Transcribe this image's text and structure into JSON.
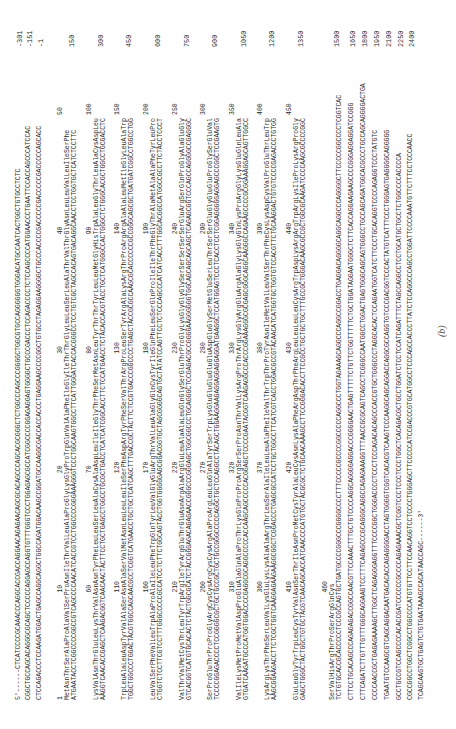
{
  "figure": {
    "label": "(b)",
    "start_marker": "5'------",
    "end_marker": "------3'"
  },
  "rows": [
    {
      "nt": "5'------CTCATCCCCGCAAACCCAGGCACCGACCAGGAACAGAGAACAGCGCACAGCCCAGCACGCGGGCTCTGGCCCAGCCCGGGGCTGGCGTGCCAGGGGGGTGGGACATGCCAATCACTGGCTGTGCCTCTC",
      "end": "-301",
      "x": 19
    },
    {
      "nt": "CGGCTGCCAGCACAGGGCGCAGCTCCCCCAGGAGCCAGGTGTTTGGGTCCCTGGAGAGCGCCATCGGCCCCGGAGAGGAGTGGGGCTGCCCGACCCTCCAGACCCCTCTCCAGCCCCATGGAACCCTGAATTCCACCAGCCCATCCAC",
      "end": "-151",
      "x": 29
    },
    {
      "nt": "CTCCAGACCCTCCAAGATGGACTGAGCCAGGCAGGCTGGCCAGATGGACAAGCCGGATGCCAAGGCGACCACCACCCTGAGGAAGCCCCGGCTGTGCCTAGAGGAAGGGGCTGCCCACCCCGACCCCCGACCCCCGACCCCCAGCACC",
      "end": "-1",
      "x": 40
    },
    {
      "pos": [
        1,
        10,
        20,
        30,
        40,
        50
      ],
      "aa": "MetAsnThrSerAlaProAlaValSerProAsnIleThrValLeuAlaProGlyLysGlyProTrpGlnValAlaPheIleGlyIleThrThrGlyLeuLeuSerLeuAlaThrValThrGlyAsnLeuLeuValLeuIleSerPhe",
      "nt": "ATGAATACCTCGGCCCCGGCCGTCAGCCCCAACATCACCGTCCTGGCCCCGGGAAAGGGTCCCTGGCAAGTGGCCTTCATTGGGATCACCACGGGCCTCCTGTCGCTAGCCACAGTGACAGGCAACCTCCTGGTGCTCATCTCCTTC",
      "end": "150",
      "x": 75
    },
    {
      "pos": [
        60,
        70,
        80,
        90,
        100
      ],
      "aa": "LysValAsnThrGluLeuLysThrValAsnAsnTyrPheLeuLeuSerLeuAlaCysAlaAspLeuIleIleGlyThrPheSerMetAsnLeuTyrThrThrTyrLeuLeuMetGlyHisTrpAlaLeuGlyThrLeuAlaCysAspLeu",
      "nt": "AAGGTCAACACCGAGCTCAAGACGGTCAACAACTACTTCCTGCTGAGCCTGGCCTGCGCTGACCTCATCATCGGCACCTTCTCCATGAACCTCTACACCACGTACCTGCTCATGGGCCACTGGGCTCTGGGCACGCTGGCCTGCGACCTC",
      "end": "300",
      "x": 104
    },
    {
      "pos": [
        110,
        120,
        130,
        140,
        150
      ],
      "aa": "TrpLeuAlaLeuAspTyrValAlaSerAsnAlaSerValMetAsnLeuLeuLeuIleSerPheAspArgTyrPheSerValThrArgProLeuSerTyrArgAlaLysArgThrProArgArgAlaAlaLeuMetIleGlyLeuAlaTrp",
      "nt": "TGGCTGGCCCTGGACTACGTGGCCAGCAACGCCTCGGTCATGAACCTGCTGCTCATCAGCTTTGACCGCTACTTCTCCGTGACCCGGCCCCTGAGCTACCGCGCCAAGCGCACCCCCCGCCGGGCAGCGCTGATGATCGGCCTGGCCTGG",
      "end": "450",
      "x": 132
    },
    {
      "pos": [
        160,
        170,
        180,
        190,
        200
      ],
      "aa": "LeuValSerPheValLeuTrpAlaProAlaIleLeuPheTrpGlnTyrLeuValGlyGluArgThrValLeuAlaGlyGlnCysTyrIleGlnPheLeuSerGlnProIleIleThrPheGlyThrAlaMetAlaAlaPheTyrLeuPro",
      "nt": "CTGGTCTCCTTCGTCCTTTGGGCCCCCGCCATCCTCTTCTGGCAGTACCTGGTGGGGGAGCGGACGGTGCTAGCGGGGCAGTGCTATATCCAGTTCCTCTCCCAGCCCATCATCACCTTTGGCACGGCCATGGCCGCCTTCTACCTCCCT",
      "end": "600",
      "x": 161
    },
    {
      "pos": [
        210,
        220,
        230,
        240,
        250
      ],
      "aa": "ValThrValMetCysThrLeuTyrTrpArgIleTyrArgGluThrGluAsnArgAlaArgGluLeuAlaAlaLeuGlnGlySerGluThrProGlyLysGlyGlyGlySerSerSerSerSerGluArgSerGlnProGlyAlaGluGly",
      "nt": "GTCACGGTCATGTGCACACTCTACTGGCGCATCTACCGGGAGACAGAGAACCGGGCCCGGGAGCTGGCGGCCCTGCAGGGCTCCGAGACGCCGGGGAAGGGGGGTGGCAGCAGCAGCAGCTCAGAGCGGTCCCAGCCAGGGGCCGAGGGC",
      "end": "750",
      "x": 190
    },
    {
      "pos": [
        260,
        270,
        280,
        290,
        300
      ],
      "aa": "SerProGluThrProProGlyArgCysCysArgCysCysArgAlaProArgLeuLeuGlnAlaTyrSerTrpLysGluGluGluGluGluAspGluGlySerMetGluSerLeuThrSerSerGluGlyGluGluProGlySerGluVal",
      "nt": "TCCCCGGAGACCCCTCCGGGGCGCTGCTGCCGCTGCTGCCGGGCCCCCAGGCTGCTCCAGGCCTACAGCTGGAAGGAAGAGGAGGAGGAGGATGAAGGCTCCATGGAGTCCCTCACCTCCTCGGAGGGGGAGGAGCCCGGCTCCGAAGTG",
      "end": "900",
      "x": 218
    },
    {
      "pos": [
        310,
        320,
        330,
        340,
        350
      ],
      "aa": "ValIleLysMetProMetValAspProGluAlaGlnAlaProThrLysGlnProProArgSerSerProAsnThrValLysArgProThrArgLysGlyArgGluArgAlaGlyLysGlyGlnLysProArgGlyLysGluGlnLeuAla",
      "nt": "GTGATCAAGATGCCCATGGTGGACCCCGAGGCGCAGGCCCCCACCAAGCAGCCCCCACGGAGCTCCCCGAATACGGTCAAGAGGCCCACCCGGAAAGGGCGCGAGCGGGCAGGCAAGGGCCAGAAGCCCCGCGGAAAGGAGCAGTTGGCC",
      "end": "1050",
      "x": 247
    },
    {
      "pos": [
        360,
        370,
        380,
        390,
        400
      ],
      "aa": "LysArgLysThrPheSerLeuValLysGluLysLysAlaAlaArgThrLeuSerAlaIleLeuLeuAlaPheIleValThrTrpThrProTyrAsnIleMetValLeuValSerThrPheCysLysAspCysValProGluThrLeuTrp",
      "nt": "AAGCGGAAGACCTTCTCGCTGGTCAAGGAGAAGAAGGCGGCTCGGACCCTGAGCGCCATCCTGCTGGCCTTCATCGTCACCTGGACGCCGTACAACATCATGGTGCTGGTGTCCACGTTCTGCAAGGACTGTGTCCCCGAGACCCTGTGG",
      "end": "1200",
      "x": 275
    },
    {
      "pos": [
        410,
        420,
        430,
        440,
        450
      ],
      "aa": "GluLeuGlyTyrTrpLeuCysTyrValAsnSerThrIleAsnProMetCysTyrAlaLeuCysAsnLysAlaPheArgAspThrPheArgLeuLeuLeuLeuCysArgTrpAspLysArgArgTrpArgLysIleProLysArgProGly",
      "nt": "GAGCTGGGCTACTGGCTGTGCTACGTCAACAGCACCATCAACCCCATGTGCTACGCGCTCTGCAACAAAGCCTTCCGGGACACCTTCCGCCTGCTGCTGCTTTGCCGCTGGGACAAGCGCCGCTGGCGCAAGATCCCCAAGCGCCCCGGC",
      "end": "1350",
      "x": 304
    },
    {
      "pos": [
        460
      ],
      "aa": "SerValHisArgThrProSerArgGlnCys",
      "nt": "TCTGTGCACCGCACCCCCTCCCGCCAGTGCTGATGCCCCGGGCCCGGGGCCCCTTTCCCCCGCCCCGGCCCCCAGGCCCTGGTAGAAAGCAGGCCCAGGCCGGACCTGAGGACAGGGGCAGGCAGGCCCAGGGGCTTCCCCCGGCCCCTCGGTCAC",
      "end": "1500",
      "x": 340
    },
    {
      "nt": "CTTCCTGCACAGCCCAGAGAGACCGGCCAACGTTCCAAACTTTGCTGTCCCCAGGCAGGGGAGGACCCGGGGAACTGAGTTTTTCTGTTCTGGTTTTTCTGCTGGATAGGAATGGGCTCTTCACCAGGAAGAAGCCCCGGGAGGAGGATCCGGG",
      "end": "1650",
      "x": 352
    },
    {
      "nt": "CTTCAGATCTTGTTTGTTTGGGCAGGAAGTCCTTTCAGAGCCCGCAGGGCAGGCCAGAGAAAGGTTTAACCGCGCAGTCAGCCTCGGGCCAATGGCCTGGACTGAGTGGGCAGCAGTGGGCCTGCCAGCAGATGGCACGCCCTGCCAGCAGGGGACTGA",
      "end": "1800",
      "x": 364
    },
    {
      "nt": "CCCCAACCGCTGAGAGAAAAGCTTGGCTCAGAGGGAGGTTTCCCCGGCTGGGACCCCTCCCTCCCAGACACAGCCCACCGTGCTGGGCCCTAGGCACACTCCAGAATGGTCATCTTCCCTGCACAGGTCCCCAGAGGTCCCTATGTC",
      "end": "1950",
      "x": 376
    },
    {
      "nt": "TGAATGTCCAAGCGTCAGCAGGACAATGACACACCAGAGGGGACCTAGTGGGGTCGGTCACACGTCAAGTCCCAAGGCAGCAGGACCAGGCGCCAGGTGTCCCGACGGTCCCACTATGTCATTTCCCTGGGAGTGAGGGGCAGGGGG",
      "end": "2100",
      "x": 388
    },
    {
      "nt": "GCCTGCCGTCCAGCCCCACACCGATCCCCCCGCCCCAGAGAAACGCTCGGTCCCTCCCTCCCTGGCTCACAGACGCTGCCTGGATCTCCTCCATCAGATTTCTAGCCAGGCCTCCTGCATGCTGCCTCTGGCCCCACCCCA",
      "end": "2250",
      "x": 400
    },
    {
      "nt": "CGCCGGCCTGGCTCGGCCTGGCCCCATGTGTTCCTTCCAACAGGTCCTCCCCTGGGAGCTTCCCCCATCCGACCCGTGCATGGCCTCCCAGCCACCCTTATCTCCAGGCCCAGCCTGGATTCCCCAAATGTTCTTTCCTCCCAACC",
      "end": "2400",
      "x": 411
    },
    {
      "nt": "TCAGCAAGTGCTGAGTCTGTGAATAAAGCCACATAACCAGC------3'",
      "end": "",
      "x": 422
    }
  ]
}
